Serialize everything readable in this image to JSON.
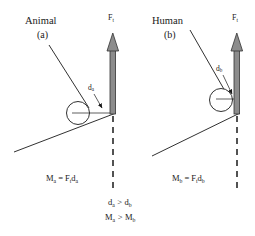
{
  "figure": {
    "width": 255,
    "height": 236,
    "background": "#ffffff",
    "ink": "#1a1a1a",
    "arrow_fill": "#8c8c8c",
    "arrow_stroke": "#333333"
  },
  "panels": [
    {
      "id": "animal",
      "title": "Animal",
      "subtitle": "(a)",
      "force_label": "F",
      "force_sub": "t",
      "distance_label": "d",
      "distance_sub": "a",
      "equation": {
        "moment": "M",
        "moment_sub": "a",
        "equals": "=",
        "force": "F",
        "force_sub": "t",
        "distance": "d",
        "distance_sub": "a"
      }
    },
    {
      "id": "human",
      "title": "Human",
      "subtitle": "(b)",
      "force_label": "F",
      "force_sub": "t",
      "distance_label": "d",
      "distance_sub": "b",
      "equation": {
        "moment": "M",
        "moment_sub": "b",
        "equals": "=",
        "force": "F",
        "force_sub": "t",
        "distance": "d",
        "distance_sub": "b"
      }
    }
  ],
  "comparison": {
    "distance": {
      "left": "d",
      "left_sub": "a",
      "operator": ">",
      "right": "d",
      "right_sub": "b"
    },
    "moment": {
      "left": "M",
      "left_sub": "a",
      "operator": ">",
      "right": "M",
      "right_sub": "b"
    }
  }
}
